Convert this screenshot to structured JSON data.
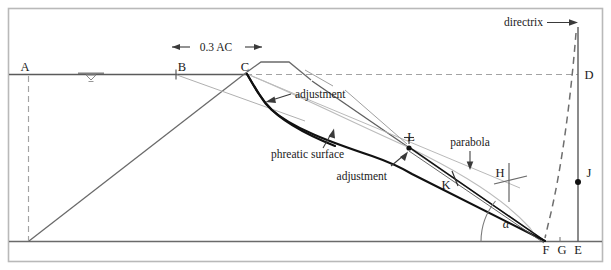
{
  "figure": {
    "type": "engineering-diagram",
    "background": "#ffffff",
    "frame_color": "#b9b9b9",
    "line_color": "#4a4a4a",
    "thin_line_color": "#8c8c8c",
    "heavy_line_color": "#1a1a1a",
    "dash_color": "#9a9a9a"
  },
  "point_labels": [
    {
      "id": "A",
      "text": "A",
      "x": 28,
      "y": 76
    },
    {
      "id": "B",
      "text": "B",
      "x": 178,
      "y": 76
    },
    {
      "id": "C",
      "text": "C",
      "x": 244,
      "y": 76
    },
    {
      "id": "D",
      "text": "D",
      "x": 586,
      "y": 76
    },
    {
      "id": "E",
      "text": "E",
      "x": 578,
      "y": 252
    },
    {
      "id": "F",
      "text": "F",
      "x": 544,
      "y": 252
    },
    {
      "id": "G",
      "text": "G",
      "x": 561,
      "y": 252
    },
    {
      "id": "H",
      "text": "H",
      "x": 498,
      "y": 176
    },
    {
      "id": "J",
      "text": "J",
      "x": 586,
      "y": 179
    },
    {
      "id": "K",
      "text": "K",
      "x": 443,
      "y": 185
    },
    {
      "id": "L",
      "text": "L",
      "x": 409,
      "y": 141
    }
  ],
  "annotations": [
    {
      "id": "directrix",
      "text": "directrix"
    },
    {
      "id": "adjustment_upper",
      "text": "adjustment"
    },
    {
      "id": "adjustment_lower",
      "text": "adjustment"
    },
    {
      "id": "phreatic_surface",
      "text": "phreatic surface"
    },
    {
      "id": "parabola",
      "text": "parabola"
    }
  ],
  "dimension": {
    "label": "0.3 AC",
    "from_point": "A",
    "to_point": "C"
  },
  "angle": {
    "symbol": "α",
    "at_point": "F",
    "description": "downstream slope angle"
  },
  "symbols": {
    "water_table": "water-table-symbol"
  }
}
